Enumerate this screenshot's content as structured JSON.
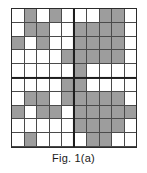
{
  "figure": {
    "caption": "Fig. 1(a)",
    "colors": {
      "filled_cell": "#9d9d9d",
      "empty_cell": "#ffffff",
      "cell_border": "#4a4a4a",
      "outer_border": "#2b2b2b",
      "divider": "#1d1d1d",
      "background": "#ffffff",
      "caption_text": "#1a1a1a"
    }
  },
  "chart_data": {
    "type": "heatmap",
    "title": "Fig. 1(a)",
    "subtitle": "",
    "xlabel": "",
    "ylabel": "",
    "rows": 10,
    "cols": 10,
    "grid_on": true,
    "legend_position": "none",
    "quadrant_dividers": {
      "vertical_after_col": 5,
      "horizontal_after_row": 5
    },
    "value_legend": {
      "0": "empty (white)",
      "1": "filled (gray)"
    },
    "row_labels": [
      "1",
      "2",
      "3",
      "4",
      "5",
      "6",
      "7",
      "8",
      "9",
      "10"
    ],
    "col_labels": [
      "1",
      "2",
      "3",
      "4",
      "5",
      "6",
      "7",
      "8",
      "9",
      "10"
    ],
    "values": [
      [
        0,
        1,
        0,
        1,
        0,
        0,
        0,
        1,
        1,
        0
      ],
      [
        0,
        1,
        1,
        0,
        0,
        1,
        1,
        1,
        1,
        0
      ],
      [
        1,
        0,
        1,
        0,
        0,
        1,
        1,
        1,
        1,
        0
      ],
      [
        0,
        0,
        0,
        0,
        1,
        1,
        1,
        1,
        1,
        0
      ],
      [
        0,
        0,
        0,
        0,
        0,
        1,
        0,
        0,
        0,
        0
      ],
      [
        0,
        0,
        0,
        0,
        1,
        1,
        0,
        0,
        0,
        0
      ],
      [
        0,
        1,
        1,
        0,
        1,
        1,
        1,
        1,
        1,
        0
      ],
      [
        1,
        0,
        1,
        1,
        0,
        1,
        1,
        1,
        1,
        1
      ],
      [
        0,
        0,
        0,
        0,
        0,
        1,
        1,
        1,
        1,
        0
      ],
      [
        0,
        1,
        0,
        0,
        0,
        0,
        1,
        1,
        0,
        0
      ]
    ]
  }
}
